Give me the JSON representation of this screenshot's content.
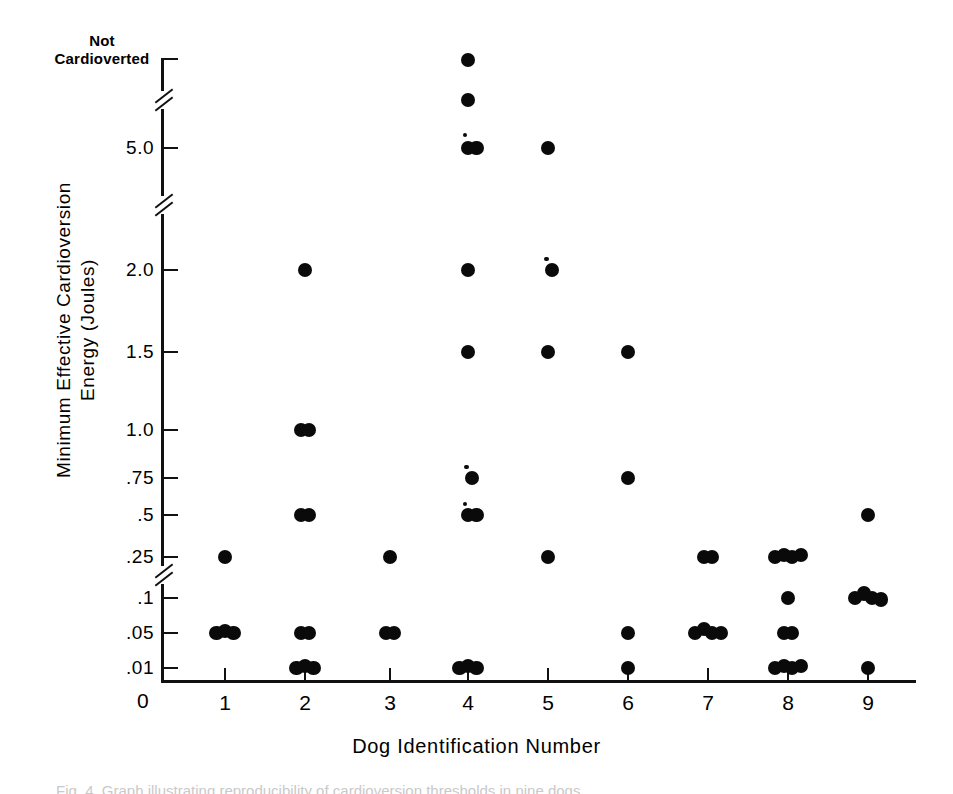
{
  "figure": {
    "top_label": {
      "line1": "Not",
      "line2": "Cardioverted"
    },
    "caption_sliver": "Fig. 4. Graph illustrating  reproducibility  of  cardioversion  thresholds in nine  dogs."
  },
  "chart_data": {
    "type": "scatter",
    "title": "",
    "xlabel": "Dog Identification Number",
    "ylabel": "Minimum Effective Cardioversion Energy (Joules)",
    "ylabel_line1": "Minimum Effective Cardioversion",
    "ylabel_line2": "Energy (Joules)",
    "grid": false,
    "legend": "none",
    "x_categories": [
      "1",
      "2",
      "3",
      "4",
      "5",
      "6",
      "7",
      "8",
      "9"
    ],
    "x_tick_labels": [
      "1",
      "2",
      "3",
      "4",
      "5",
      "6",
      "7",
      "8",
      "9"
    ],
    "x_origin_label": "0",
    "y_tick_labels": [
      "Not Cardioverted",
      "5.0",
      "2.0",
      "1.5",
      "1.0",
      ".75",
      ".5",
      ".25",
      ".1",
      ".05",
      ".01",
      "0"
    ],
    "y_axis_breaks": 3,
    "y_axis_note": "Broken (non-linear) ordinate: breaks between 5.0 and Not Cardioverted, between 5.0 and 2.0, and between .25 and .1",
    "points": [
      {
        "dog": 1,
        "energy": ".25",
        "count": 1
      },
      {
        "dog": 1,
        "energy": ".05",
        "count": 3
      },
      {
        "dog": 2,
        "energy": "2.0",
        "count": 1
      },
      {
        "dog": 2,
        "energy": "1.0",
        "count": 2
      },
      {
        "dog": 2,
        "energy": ".5",
        "count": 2
      },
      {
        "dog": 2,
        "energy": ".05",
        "count": 2
      },
      {
        "dog": 2,
        "energy": ".01",
        "count": 3
      },
      {
        "dog": 3,
        "energy": ".25",
        "count": 1
      },
      {
        "dog": 3,
        "energy": ".05",
        "count": 2
      },
      {
        "dog": 4,
        "energy": "Not Cardioverted",
        "count": 1
      },
      {
        "dog": 4,
        "energy": "above 5.0",
        "count": 1
      },
      {
        "dog": 4,
        "energy": "5.0",
        "count": 3
      },
      {
        "dog": 4,
        "energy": "2.0",
        "count": 1
      },
      {
        "dog": 4,
        "energy": "1.5",
        "count": 1
      },
      {
        "dog": 4,
        "energy": ".75",
        "count": 2
      },
      {
        "dog": 4,
        "energy": ".5",
        "count": 3
      },
      {
        "dog": 4,
        "energy": ".01",
        "count": 3
      },
      {
        "dog": 5,
        "energy": "5.0",
        "count": 1
      },
      {
        "dog": 5,
        "energy": "2.0",
        "count": 2
      },
      {
        "dog": 5,
        "energy": "1.5",
        "count": 1
      },
      {
        "dog": 5,
        "energy": ".25",
        "count": 1
      },
      {
        "dog": 6,
        "energy": "1.5",
        "count": 1
      },
      {
        "dog": 6,
        "energy": ".75",
        "count": 1
      },
      {
        "dog": 6,
        "energy": ".05",
        "count": 1
      },
      {
        "dog": 6,
        "energy": ".01",
        "count": 1
      },
      {
        "dog": 7,
        "energy": ".25",
        "count": 2
      },
      {
        "dog": 7,
        "energy": ".05",
        "count": 4
      },
      {
        "dog": 8,
        "energy": ".25",
        "count": 4
      },
      {
        "dog": 8,
        "energy": ".1",
        "count": 1
      },
      {
        "dog": 8,
        "energy": ".05",
        "count": 2
      },
      {
        "dog": 8,
        "energy": ".01",
        "count": 4
      },
      {
        "dog": 9,
        "energy": ".5",
        "count": 1
      },
      {
        "dog": 9,
        "energy": ".1",
        "count": 4
      },
      {
        "dog": 9,
        "energy": ".01",
        "count": 1
      }
    ],
    "colors": {
      "marker": "#0a0a0a",
      "axis": "#111111",
      "background": "#ffffff"
    }
  },
  "geometry": {
    "y_positions": {
      "Not Cardioverted": 60,
      "above 5.0": 100,
      "5.0": 148,
      "2.0": 270,
      "1.5": 352,
      "1.0": 430,
      ".75": 478,
      ".5": 515,
      ".25": 557,
      ".1": 598,
      ".05": 633,
      ".01": 668
    },
    "x_positions": {
      "1": 225,
      "2": 305,
      "3": 390,
      "4": 468,
      "5": 548,
      "6": 628,
      "7": 708,
      "8": 788,
      "9": 868
    }
  }
}
